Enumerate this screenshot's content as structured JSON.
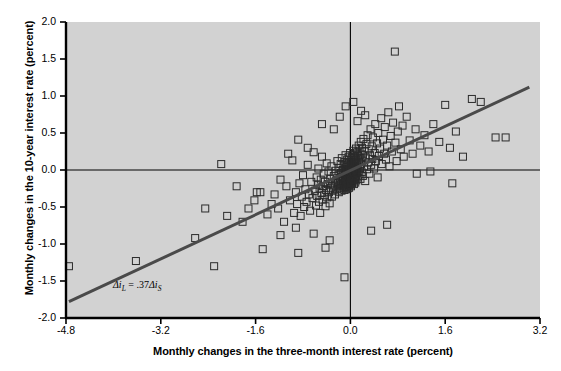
{
  "chart_data": {
    "type": "scatter",
    "title": "",
    "xlabel": "Monthly changes in the three-month interest rate (percent)",
    "ylabel": "Monthly changes in the 10-year interest rate (percent)",
    "xlim": [
      -4.8,
      3.2
    ],
    "ylim": [
      -2.0,
      2.0
    ],
    "xticks": [
      -4.8,
      -3.2,
      -1.6,
      0.0,
      1.6,
      3.2
    ],
    "xticklabels": [
      "-4.8",
      "-3.2",
      "-1.6",
      "0.0",
      "1.6",
      "3.2"
    ],
    "yticks": [
      -2.0,
      -1.5,
      -1.0,
      -0.5,
      0.0,
      0.5,
      1.0,
      1.5,
      2.0
    ],
    "yticklabels": [
      "-2.0",
      "-1.5",
      "-1.0",
      "-0.5",
      "0.0",
      "0.5",
      "1.0",
      "1.5",
      "2.0"
    ],
    "grid": false,
    "legend": null,
    "plot_bgcolor": "#d2d2d2",
    "marker": {
      "shape": "open-square",
      "size": 7,
      "edgecolor": "#2b2b2b",
      "facecolor": "none"
    },
    "annotations": [
      {
        "text": "Δi_L = .37Δi_S",
        "x": -2.9,
        "y": -1.62,
        "latex": "\\Delta i_L = .37 \\Delta i_S"
      }
    ],
    "fit_line": {
      "label": "Δi_L = .37Δi_S",
      "slope": 0.37,
      "intercept": 0.0,
      "color": "#4a4a4a",
      "width": 3,
      "x_start": -4.75,
      "y_start": -1.78,
      "x_end": 3.02,
      "y_end": 1.12
    },
    "points": [
      [
        -4.75,
        -1.3
      ],
      [
        -3.62,
        -1.23
      ],
      [
        -2.62,
        -0.92
      ],
      [
        -2.3,
        -1.3
      ],
      [
        -2.08,
        -0.62
      ],
      [
        -1.82,
        -0.7
      ],
      [
        -1.72,
        -0.52
      ],
      [
        -1.62,
        -0.41
      ],
      [
        -1.52,
        -0.3
      ],
      [
        -1.48,
        -1.07
      ],
      [
        -1.4,
        -0.6
      ],
      [
        -1.33,
        -0.46
      ],
      [
        -1.28,
        -0.33
      ],
      [
        -1.22,
        -0.52
      ],
      [
        -1.18,
        -0.13
      ],
      [
        -1.12,
        -0.7
      ],
      [
        -1.08,
        -0.22
      ],
      [
        -1.02,
        -0.41
      ],
      [
        -0.98,
        0.13
      ],
      [
        -0.95,
        -0.58
      ],
      [
        -0.92,
        -0.3
      ],
      [
        -0.9,
        -0.46
      ],
      [
        -0.88,
        0.41
      ],
      [
        -0.86,
        -0.18
      ],
      [
        -0.84,
        -0.62
      ],
      [
        -0.82,
        -0.36
      ],
      [
        -0.8,
        -0.07
      ],
      [
        -0.78,
        -0.5
      ],
      [
        -0.76,
        -0.26
      ],
      [
        -0.74,
        -0.43
      ],
      [
        -0.72,
        0.07
      ],
      [
        -0.7,
        -0.33
      ],
      [
        -0.68,
        -0.55
      ],
      [
        -0.66,
        -0.16
      ],
      [
        -0.64,
        -0.38
      ],
      [
        -0.62,
        0.24
      ],
      [
        -0.6,
        -0.28
      ],
      [
        -0.58,
        -0.48
      ],
      [
        -0.57,
        -0.1
      ],
      [
        -0.56,
        -0.35
      ],
      [
        -0.55,
        -0.2
      ],
      [
        -0.54,
        0.02
      ],
      [
        -0.53,
        -0.43
      ],
      [
        -0.52,
        -0.25
      ],
      [
        -0.51,
        -0.58
      ],
      [
        -0.5,
        -0.13
      ],
      [
        -0.49,
        -0.31
      ],
      [
        -0.48,
        0.18
      ],
      [
        -0.47,
        -0.4
      ],
      [
        -0.46,
        -0.22
      ],
      [
        -0.45,
        -0.05
      ],
      [
        -0.44,
        -0.34
      ],
      [
        -0.43,
        -0.16
      ],
      [
        -0.42,
        -0.49
      ],
      [
        -0.41,
        -0.27
      ],
      [
        -0.4,
        0.09
      ],
      [
        -0.39,
        -0.37
      ],
      [
        -0.38,
        -0.19
      ],
      [
        -0.37,
        -0.02
      ],
      [
        -0.36,
        -0.3
      ],
      [
        -0.35,
        -0.45
      ],
      [
        -0.34,
        -0.12
      ],
      [
        -0.33,
        -0.24
      ],
      [
        -0.32,
        0.05
      ],
      [
        -0.31,
        -0.36
      ],
      [
        -0.3,
        -0.17
      ],
      [
        -0.29,
        -0.28
      ],
      [
        -0.28,
        -0.08
      ],
      [
        -0.27,
        -0.21
      ],
      [
        -0.26,
        -0.33
      ],
      [
        -0.25,
        -0.01
      ],
      [
        -0.24,
        -0.14
      ],
      [
        -0.23,
        -0.26
      ],
      [
        -0.22,
        0.12
      ],
      [
        -0.21,
        -0.18
      ],
      [
        -0.2,
        -0.06
      ],
      [
        -0.195,
        -0.3
      ],
      [
        -0.19,
        -0.22
      ],
      [
        -0.185,
        0.03
      ],
      [
        -0.18,
        -0.11
      ],
      [
        -0.175,
        -0.25
      ],
      [
        -0.17,
        -0.15
      ],
      [
        -0.165,
        0.08
      ],
      [
        -0.16,
        -0.04
      ],
      [
        -0.155,
        -0.19
      ],
      [
        -0.15,
        -0.28
      ],
      [
        -0.145,
        0.16
      ],
      [
        -0.14,
        -0.09
      ],
      [
        -0.135,
        -0.21
      ],
      [
        -0.13,
        0.0
      ],
      [
        -0.125,
        -0.13
      ],
      [
        -0.12,
        -0.24
      ],
      [
        -0.115,
        0.06
      ],
      [
        -0.11,
        -0.17
      ],
      [
        -0.105,
        -0.05
      ],
      [
        -0.1,
        -0.27
      ],
      [
        -0.098,
        0.11
      ],
      [
        -0.095,
        -0.1
      ],
      [
        -0.092,
        -0.2
      ],
      [
        -0.09,
        0.01
      ],
      [
        -0.088,
        -0.14
      ],
      [
        -0.085,
        -0.23
      ],
      [
        -0.082,
        0.2
      ],
      [
        -0.08,
        -0.07
      ],
      [
        -0.078,
        -0.16
      ],
      [
        -0.075,
        -0.02
      ],
      [
        -0.072,
        -0.26
      ],
      [
        -0.07,
        0.09
      ],
      [
        -0.068,
        -0.12
      ],
      [
        -0.065,
        -0.19
      ],
      [
        -0.062,
        0.04
      ],
      [
        -0.06,
        -0.08
      ],
      [
        -0.058,
        -0.22
      ],
      [
        -0.055,
        0.14
      ],
      [
        -0.052,
        -0.03
      ],
      [
        -0.05,
        -0.15
      ],
      [
        -0.048,
        -0.25
      ],
      [
        -0.045,
        0.07
      ],
      [
        -0.042,
        -0.1
      ],
      [
        -0.04,
        -0.18
      ],
      [
        -0.038,
        0.02
      ],
      [
        -0.035,
        -0.06
      ],
      [
        -0.032,
        -0.21
      ],
      [
        -0.03,
        0.18
      ],
      [
        -0.028,
        -0.13
      ],
      [
        -0.025,
        -0.01
      ],
      [
        -0.022,
        -0.24
      ],
      [
        -0.02,
        0.1
      ],
      [
        -0.018,
        -0.08
      ],
      [
        -0.015,
        -0.17
      ],
      [
        -0.012,
        0.05
      ],
      [
        -0.01,
        -0.04
      ],
      [
        -0.008,
        -0.2
      ],
      [
        -0.005,
        0.23
      ],
      [
        -0.002,
        -0.11
      ],
      [
        0.0,
        0.0
      ],
      [
        0.002,
        -0.15
      ],
      [
        0.005,
        0.13
      ],
      [
        0.008,
        -0.06
      ],
      [
        0.01,
        -0.22
      ],
      [
        0.012,
        0.08
      ],
      [
        0.015,
        -0.02
      ],
      [
        0.018,
        -0.13
      ],
      [
        0.02,
        0.16
      ],
      [
        0.022,
        -0.09
      ],
      [
        0.025,
        0.03
      ],
      [
        0.028,
        -0.18
      ],
      [
        0.03,
        0.11
      ],
      [
        0.032,
        -0.05
      ],
      [
        0.035,
        -0.16
      ],
      [
        0.038,
        0.2
      ],
      [
        0.04,
        -0.01
      ],
      [
        0.042,
        -0.11
      ],
      [
        0.045,
        0.06
      ],
      [
        0.048,
        -0.07
      ],
      [
        0.05,
        0.26
      ],
      [
        0.052,
        -0.14
      ],
      [
        0.055,
        0.09
      ],
      [
        0.058,
        -0.03
      ],
      [
        0.06,
        0.17
      ],
      [
        0.062,
        -0.19
      ],
      [
        0.065,
        0.02
      ],
      [
        0.068,
        -0.09
      ],
      [
        0.07,
        0.13
      ],
      [
        0.072,
        -0.05
      ],
      [
        0.075,
        0.22
      ],
      [
        0.078,
        -0.12
      ],
      [
        0.08,
        0.05
      ],
      [
        0.082,
        -0.17
      ],
      [
        0.085,
        0.1
      ],
      [
        0.088,
        -0.02
      ],
      [
        0.09,
        0.18
      ],
      [
        0.092,
        -0.08
      ],
      [
        0.095,
        0.29
      ],
      [
        0.098,
        0.01
      ],
      [
        0.1,
        -0.14
      ],
      [
        0.105,
        0.14
      ],
      [
        0.11,
        -0.04
      ],
      [
        0.115,
        0.24
      ],
      [
        0.12,
        0.06
      ],
      [
        0.125,
        -0.1
      ],
      [
        0.13,
        0.19
      ],
      [
        0.135,
        -0.01
      ],
      [
        0.14,
        0.33
      ],
      [
        0.145,
        0.11
      ],
      [
        0.15,
        -0.06
      ],
      [
        0.155,
        0.26
      ],
      [
        0.16,
        0.03
      ],
      [
        0.165,
        0.16
      ],
      [
        0.17,
        -0.12
      ],
      [
        0.175,
        0.38
      ],
      [
        0.18,
        0.08
      ],
      [
        0.185,
        0.21
      ],
      [
        0.19,
        -0.03
      ],
      [
        0.195,
        0.3
      ],
      [
        0.2,
        0.13
      ],
      [
        0.21,
        -0.08
      ],
      [
        0.22,
        0.42
      ],
      [
        0.23,
        0.05
      ],
      [
        0.24,
        0.25
      ],
      [
        0.25,
        -0.15
      ],
      [
        0.26,
        0.17
      ],
      [
        0.27,
        0.35
      ],
      [
        0.28,
        0.01
      ],
      [
        0.29,
        0.47
      ],
      [
        0.3,
        0.1
      ],
      [
        0.31,
        0.28
      ],
      [
        0.32,
        -0.05
      ],
      [
        0.33,
        0.2
      ],
      [
        0.34,
        0.55
      ],
      [
        0.35,
        0.07
      ],
      [
        0.36,
        0.32
      ],
      [
        0.37,
        0.15
      ],
      [
        0.38,
        0.44
      ],
      [
        0.4,
        0.02
      ],
      [
        0.41,
        0.23
      ],
      [
        0.42,
        0.62
      ],
      [
        0.43,
        0.12
      ],
      [
        0.45,
        0.36
      ],
      [
        0.46,
        -0.1
      ],
      [
        0.47,
        0.5
      ],
      [
        0.48,
        0.19
      ],
      [
        0.5,
        0.29
      ],
      [
        0.52,
        0.7
      ],
      [
        0.53,
        0.08
      ],
      [
        0.55,
        0.41
      ],
      [
        0.57,
        0.22
      ],
      [
        0.58,
        0.58
      ],
      [
        0.6,
        0.14
      ],
      [
        0.62,
        0.33
      ],
      [
        0.64,
        0.78
      ],
      [
        0.66,
        0.05
      ],
      [
        0.68,
        0.46
      ],
      [
        0.7,
        0.25
      ],
      [
        0.72,
        0.64
      ],
      [
        0.75,
        1.6
      ],
      [
        0.76,
        0.37
      ],
      [
        0.78,
        0.12
      ],
      [
        0.8,
        0.52
      ],
      [
        0.82,
        0.86
      ],
      [
        0.85,
        0.28
      ],
      [
        0.88,
        0.6
      ],
      [
        0.9,
        0.18
      ],
      [
        0.95,
        0.72
      ],
      [
        1.0,
        0.4
      ],
      [
        1.05,
        0.22
      ],
      [
        1.1,
        0.55
      ],
      [
        1.18,
        0.33
      ],
      [
        1.25,
        0.47
      ],
      [
        1.32,
        0.25
      ],
      [
        1.4,
        0.62
      ],
      [
        1.5,
        0.38
      ],
      [
        1.6,
        0.88
      ],
      [
        1.68,
        0.3
      ],
      [
        1.78,
        0.52
      ],
      [
        1.9,
        0.18
      ],
      [
        2.05,
        0.96
      ],
      [
        2.2,
        0.92
      ],
      [
        2.45,
        0.44
      ],
      [
        2.62,
        0.44
      ],
      [
        1.72,
        -0.18
      ],
      [
        1.35,
        -0.02
      ],
      [
        1.12,
        -0.05
      ],
      [
        0.62,
        -0.74
      ],
      [
        0.35,
        -0.82
      ],
      [
        -0.1,
        -1.45
      ],
      [
        -0.35,
        -0.95
      ],
      [
        -0.62,
        -0.86
      ],
      [
        -0.92,
        -0.78
      ],
      [
        -1.58,
        -0.3
      ],
      [
        -0.48,
        0.62
      ],
      [
        -0.28,
        0.55
      ],
      [
        -0.18,
        0.72
      ],
      [
        -0.08,
        0.86
      ],
      [
        0.05,
        0.92
      ],
      [
        0.12,
        0.66
      ],
      [
        0.18,
        0.8
      ],
      [
        0.25,
        0.74
      ],
      [
        -0.72,
        0.3
      ],
      [
        -1.05,
        0.22
      ],
      [
        -2.18,
        0.08
      ],
      [
        -1.92,
        -0.22
      ],
      [
        -2.45,
        -0.52
      ],
      [
        -0.42,
        -1.05
      ],
      [
        -0.88,
        -1.12
      ],
      [
        -1.18,
        -0.88
      ]
    ]
  }
}
